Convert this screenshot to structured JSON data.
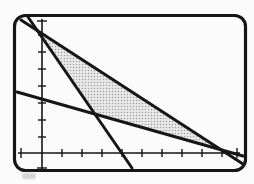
{
  "figure": {
    "width_px": 254,
    "height_px": 184,
    "background": "#fbfbfb",
    "ink_color": "#161616",
    "frame": {
      "x": 14.5,
      "y": 15.5,
      "width": 231,
      "height": 155,
      "radius": 11,
      "stroke": "#161616",
      "stroke_width": 3.2
    },
    "print_smudge": {
      "x": 22,
      "y": 173,
      "width": 14,
      "height": 6,
      "color": "#b4b4b4",
      "opacity": 0.55
    }
  },
  "chart_data": {
    "type": "line",
    "title": "",
    "grid": "off",
    "legend": "none",
    "axes": {
      "x_axis": {
        "y_px": 153,
        "from_px": 18,
        "to_px": 240,
        "ticks_px": [
          62,
          82,
          102,
          122,
          142,
          162,
          182,
          202,
          222
        ],
        "end_caps_px": [
          21,
          237
        ],
        "labels": []
      },
      "y_axis": {
        "x_px": 42,
        "from_px": 19,
        "to_px": 170,
        "ticks_px": [
          35,
          52,
          69,
          86,
          103,
          120,
          137
        ],
        "end_caps_px": [
          21,
          168
        ],
        "labels": []
      },
      "tick_unit_px": 17,
      "origin_px": [
        42,
        153
      ]
    },
    "line_width_px": 3,
    "axis_width_px": 1.6,
    "tick_width_px": 1.4,
    "tick_half_len_px": 4,
    "cap_half_len_px": 5,
    "series": [
      {
        "name": "steep-line",
        "endpoints_px": [
          [
            28,
            17
          ],
          [
            132,
            168
          ]
        ],
        "approx_slope_ticks": -1.45,
        "approx_x_intercept_ticks": 5.3,
        "approx_y_intercept_ticks": 7.7
      },
      {
        "name": "medium-line",
        "endpoints_px": [
          [
            21,
            20
          ],
          [
            243,
            164
          ]
        ],
        "approx_slope_ticks": -0.65,
        "approx_x_intercept_ticks": 12.3,
        "approx_y_intercept_ticks": 8.0
      },
      {
        "name": "shallow-line",
        "endpoints_px": [
          [
            17,
            92
          ],
          [
            243,
            156
          ]
        ],
        "approx_slope_ticks": -0.28,
        "approx_x_intercept_ticks": 12.7,
        "approx_y_intercept_ticks": 3.6
      }
    ],
    "shaded_region": {
      "vertices_px": [
        [
          37.4,
          30.6
        ],
        [
          94.8,
          114.0
        ],
        [
          220.8,
          149.7
        ]
      ],
      "vertices_ticks": [
        [
          -0.3,
          8.2
        ],
        [
          3.5,
          2.6
        ],
        [
          11.9,
          0.2
        ]
      ],
      "fill_style": "halftone-dots",
      "base_color": "#e9e9e9",
      "dot_color": "#a0a0a0"
    }
  }
}
